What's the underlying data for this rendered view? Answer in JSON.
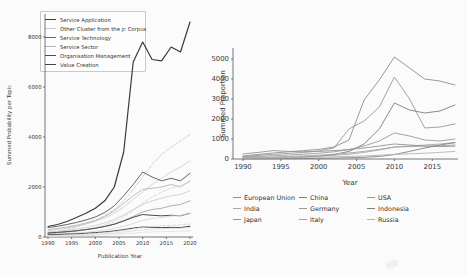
{
  "figure": {
    "background": "#fbfbfb",
    "ink_color": "#3a3a3a"
  },
  "chart_data": [
    {
      "id": "topics",
      "type": "line",
      "title": "",
      "xlabel": "Publication Year",
      "ylabel": "Summed Probability per Topic",
      "xlim": [
        1989,
        2021
      ],
      "ylim": [
        0,
        8800
      ],
      "grid": false,
      "legend_position": "upper left",
      "xticks": [
        1990,
        1995,
        2000,
        2005,
        2010,
        2015,
        2020
      ],
      "yticks": [
        0,
        2000,
        4000,
        6000,
        8000
      ],
      "x": [
        1990,
        1992,
        1994,
        1996,
        1998,
        2000,
        2002,
        2004,
        2006,
        2008,
        2010,
        2012,
        2014,
        2016,
        2018,
        2020
      ],
      "series": [
        {
          "name": "Service Application",
          "color": "#3a3a3a",
          "width": 1.2,
          "dash": false,
          "values": [
            420,
            500,
            620,
            780,
            950,
            1150,
            1450,
            2000,
            3400,
            7000,
            7800,
            7100,
            7050,
            7600,
            7400,
            8600
          ]
        },
        {
          "name": "Other Cluster from the jc Corpus (a)",
          "color": "#c4c4c4",
          "width": 0.8,
          "dash": true,
          "values": [
            150,
            220,
            300,
            400,
            520,
            660,
            850,
            1100,
            1450,
            1900,
            2400,
            2900,
            3300,
            3600,
            3850,
            4100
          ]
        },
        {
          "name": "Other Cluster from the jc Corpus (b)",
          "color": "#cccccc",
          "width": 0.8,
          "dash": false,
          "values": [
            250,
            300,
            360,
            430,
            520,
            620,
            760,
            950,
            1200,
            1500,
            1800,
            2100,
            2350,
            2600,
            2800,
            3050
          ]
        },
        {
          "name": "Service Technology",
          "color": "#666666",
          "width": 1.0,
          "dash": false,
          "values": [
            380,
            430,
            500,
            580,
            680,
            800,
            980,
            1250,
            1650,
            2100,
            2600,
            2400,
            2250,
            2350,
            2250,
            2550
          ]
        },
        {
          "name": "Service Sector",
          "color": "#b5b5b5",
          "width": 0.9,
          "dash": false,
          "values": [
            300,
            340,
            400,
            470,
            560,
            670,
            820,
            1050,
            1350,
            1650,
            1900,
            1950,
            2000,
            2100,
            2000,
            2250
          ]
        },
        {
          "name": "Other Cluster from the jc Corpus (c)",
          "color": "#d0d0d0",
          "width": 0.8,
          "dash": true,
          "values": [
            120,
            150,
            190,
            240,
            300,
            380,
            480,
            620,
            800,
            1050,
            1350,
            1600,
            1800,
            1950,
            2050,
            2200
          ]
        },
        {
          "name": "Other Cluster from the jc Corpus (d)",
          "color": "#c8c8c8",
          "width": 0.8,
          "dash": false,
          "values": [
            200,
            230,
            270,
            320,
            380,
            460,
            560,
            700,
            880,
            1100,
            1300,
            1450,
            1550,
            1650,
            1700,
            1850
          ]
        },
        {
          "name": "Other Cluster from the jc Corpus (e)",
          "color": "#9a9a9a",
          "width": 0.8,
          "dash": false,
          "values": [
            150,
            175,
            205,
            245,
            295,
            355,
            430,
            530,
            660,
            820,
            1000,
            1100,
            1150,
            1250,
            1300,
            1450
          ]
        },
        {
          "name": "Organisation Management",
          "color": "#4d4d4d",
          "width": 1.0,
          "dash": false,
          "values": [
            160,
            185,
            215,
            250,
            295,
            350,
            420,
            510,
            640,
            790,
            900,
            870,
            850,
            870,
            850,
            950
          ]
        },
        {
          "name": "Other Cluster from the jc Corpus (f)",
          "color": "#d4d4d4",
          "width": 0.8,
          "dash": false,
          "values": [
            100,
            115,
            135,
            160,
            190,
            230,
            280,
            345,
            430,
            540,
            660,
            740,
            790,
            840,
            860,
            950
          ]
        },
        {
          "name": "Value Creation",
          "color": "#444444",
          "width": 1.0,
          "dash": false,
          "values": [
            90,
            100,
            115,
            130,
            150,
            175,
            205,
            245,
            295,
            355,
            400,
            390,
            375,
            385,
            380,
            430
          ]
        },
        {
          "name": "Other Cluster from the jc Corpus (g)",
          "color": "#cfcfcf",
          "width": 0.8,
          "dash": true,
          "values": [
            60,
            70,
            85,
            100,
            120,
            145,
            175,
            215,
            265,
            325,
            390,
            430,
            450,
            470,
            480,
            520
          ]
        },
        {
          "name": "Other Cluster from the jc Corpus (h)",
          "color": "#dadada",
          "width": 0.8,
          "dash": false,
          "values": [
            40,
            48,
            58,
            70,
            85,
            105,
            130,
            160,
            200,
            245,
            290,
            315,
            330,
            345,
            350,
            380
          ]
        },
        {
          "name": "Other Cluster from the jc Corpus (i)",
          "color": "#e0e0e0",
          "width": 0.8,
          "dash": false,
          "values": [
            25,
            30,
            36,
            44,
            54,
            66,
            82,
            102,
            128,
            158,
            190,
            205,
            215,
            225,
            230,
            250
          ]
        }
      ],
      "legend_entries": [
        {
          "label": "Service Application",
          "color": "#3a3a3a",
          "dash": false
        },
        {
          "label": "Other Cluster from the jc Corpus",
          "color": "#c9c9c9",
          "dash": false
        },
        {
          "label": "Service Technology",
          "color": "#666666",
          "dash": false
        },
        {
          "label": "Service Sector",
          "color": "#b5b5b5",
          "dash": false
        },
        {
          "label": "Organisation Management",
          "color": "#4d4d4d",
          "dash": false
        },
        {
          "label": "Value Creation",
          "color": "#444444",
          "dash": false
        }
      ]
    },
    {
      "id": "countries",
      "type": "line",
      "title": "",
      "xlabel": "Year",
      "ylabel": "Summed Proportion",
      "xlim": [
        1989.5,
        2018.5
      ],
      "ylim": [
        0,
        5300
      ],
      "grid": false,
      "legend_position": "below",
      "xticks": [
        1990,
        1995,
        2000,
        2005,
        2010,
        2015
      ],
      "yticks": [
        0,
        1000,
        2000,
        3000,
        4000,
        5000
      ],
      "x": [
        1990,
        1992,
        1994,
        1996,
        1998,
        2000,
        2002,
        2004,
        2006,
        2008,
        2010,
        2012,
        2014,
        2016,
        2018
      ],
      "series": [
        {
          "name": "European Union",
          "color": "#8f8f8f",
          "width": 0.9,
          "dash": false,
          "values": [
            150,
            230,
            300,
            360,
            420,
            480,
            600,
            950,
            2950,
            3950,
            5100,
            4550,
            4000,
            3900,
            3700
          ]
        },
        {
          "name": "USA",
          "color": "#989898",
          "width": 0.9,
          "dash": false,
          "values": [
            120,
            180,
            230,
            280,
            330,
            400,
            550,
            1500,
            1900,
            2600,
            4100,
            3000,
            1550,
            1600,
            1750
          ]
        },
        {
          "name": "China",
          "color": "#7d7d7d",
          "width": 0.9,
          "dash": false,
          "values": [
            30,
            40,
            55,
            75,
            100,
            140,
            220,
            380,
            750,
            1500,
            2800,
            2450,
            2300,
            2400,
            2700
          ]
        },
        {
          "name": "Germany",
          "color": "#9b9b9b",
          "width": 0.9,
          "dash": false,
          "values": [
            100,
            130,
            160,
            200,
            240,
            290,
            360,
            470,
            650,
            900,
            1300,
            1150,
            950,
            900,
            1000
          ]
        },
        {
          "name": "India",
          "color": "#a9a9a9",
          "width": 0.9,
          "dash": false,
          "values": [
            40,
            50,
            65,
            85,
            110,
            140,
            180,
            240,
            330,
            450,
            600,
            650,
            700,
            750,
            820
          ]
        },
        {
          "name": "Japan",
          "color": "#949494",
          "width": 0.9,
          "dash": false,
          "values": [
            250,
            330,
            420,
            380,
            360,
            380,
            420,
            470,
            550,
            650,
            750,
            700,
            650,
            620,
            640
          ]
        },
        {
          "name": "Italy",
          "color": "#a3a3a3",
          "width": 0.9,
          "dash": false,
          "values": [
            60,
            80,
            100,
            125,
            155,
            190,
            240,
            300,
            380,
            480,
            600,
            620,
            640,
            660,
            700
          ]
        },
        {
          "name": "Indonesia",
          "color": "#808080",
          "width": 0.9,
          "dash": false,
          "values": [
            10,
            12,
            15,
            20,
            26,
            34,
            45,
            60,
            85,
            130,
            220,
            380,
            550,
            700,
            820
          ]
        },
        {
          "name": "Russia",
          "color": "#b5b5b5",
          "width": 0.9,
          "dash": false,
          "values": [
            50,
            55,
            62,
            70,
            80,
            92,
            108,
            128,
            155,
            190,
            230,
            260,
            290,
            330,
            380
          ]
        }
      ],
      "legend_entries": [
        {
          "label": "European Union",
          "color": "#8f8f8f",
          "dash": false
        },
        {
          "label": "China",
          "color": "#7d7d7d",
          "dash": false
        },
        {
          "label": "USA",
          "color": "#989898",
          "dash": false
        },
        {
          "label": "India",
          "color": "#a9a9a9",
          "dash": false
        },
        {
          "label": "Germany",
          "color": "#9b9b9b",
          "dash": false
        },
        {
          "label": "Indonesia",
          "color": "#808080",
          "dash": false
        },
        {
          "label": "Japan",
          "color": "#949494",
          "dash": false
        },
        {
          "label": "Italy",
          "color": "#a3a3a3",
          "dash": false
        },
        {
          "label": "Russia",
          "color": "#b5b5b5",
          "dash": false
        }
      ]
    }
  ]
}
